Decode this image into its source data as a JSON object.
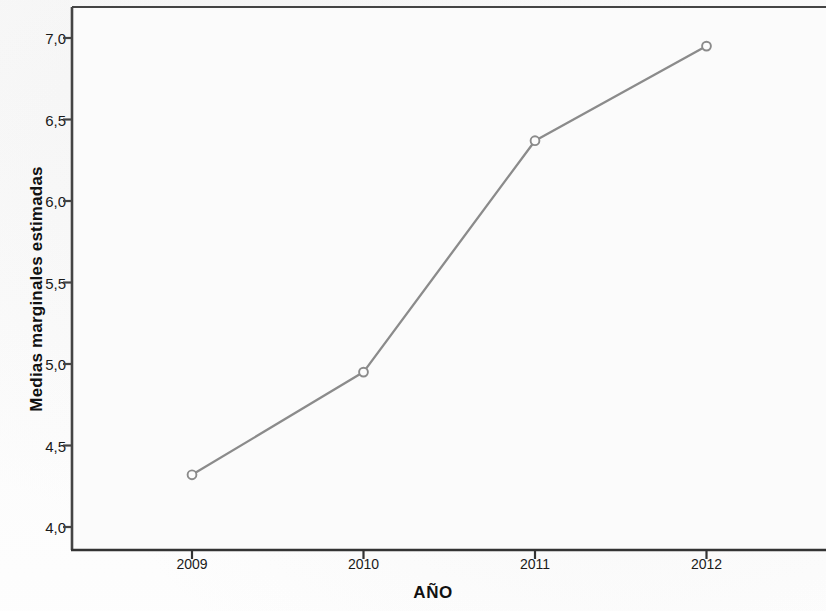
{
  "chart_data": {
    "type": "line",
    "title": "",
    "subtitle": "",
    "xlabel": "AÑO",
    "ylabel": "Medias marginales estimadas",
    "categories": [
      "2009",
      "2010",
      "2011",
      "2012"
    ],
    "values": [
      4.32,
      4.95,
      6.37,
      6.95
    ],
    "series": [
      {
        "name": "Medias marginales estimadas",
        "values": [
          4.32,
          4.95,
          6.37,
          6.95
        ]
      }
    ],
    "ylim": [
      3.87,
      7.2
    ],
    "xlim": [
      2008.5,
      2012.9
    ],
    "y_ticks": [
      "4,0",
      "4,5",
      "5,0",
      "5,5",
      "6,0",
      "6,5",
      "7,0"
    ],
    "y_tick_values": [
      4.0,
      4.5,
      5.0,
      5.5,
      6.0,
      6.5,
      7.0
    ],
    "x_ticks": [
      "2009",
      "2010",
      "2011",
      "2012"
    ],
    "grid": false,
    "legend": "none",
    "marker": "open-circle",
    "line_color": "#8b8b8b",
    "marker_color": "#8b8b8b",
    "axis_color": "#444444",
    "plot_background": "#fbfbfb"
  },
  "axis_titles": {
    "y": "Medias marginales estimadas",
    "x": "AÑO"
  }
}
